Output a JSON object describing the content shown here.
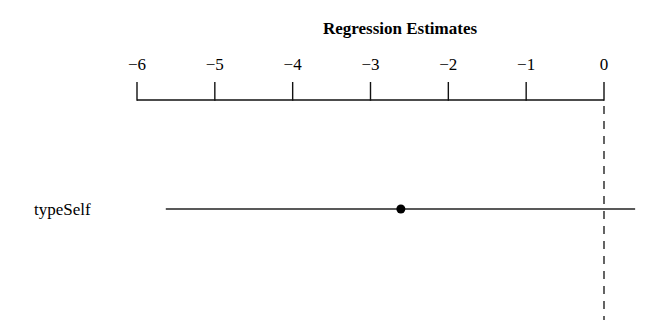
{
  "chart_data": {
    "type": "scatter",
    "subtype": "coefficient-plot",
    "title": "Regression Estimates",
    "xlabel": "",
    "ylabel": "",
    "xlim": [
      -6,
      0.45
    ],
    "x_ticks": [
      -6,
      -5,
      -4,
      -3,
      -2,
      -1,
      0
    ],
    "tick_labels": [
      "−6",
      "−5",
      "−4",
      "−3",
      "−2",
      "−1",
      "0"
    ],
    "reference_line": 0,
    "axis_position": "top",
    "grid": false,
    "legend": null,
    "series": [
      {
        "name": "typeSelf",
        "estimate": -2.61,
        "ci_low": -5.63,
        "ci_high": 0.4
      }
    ]
  }
}
